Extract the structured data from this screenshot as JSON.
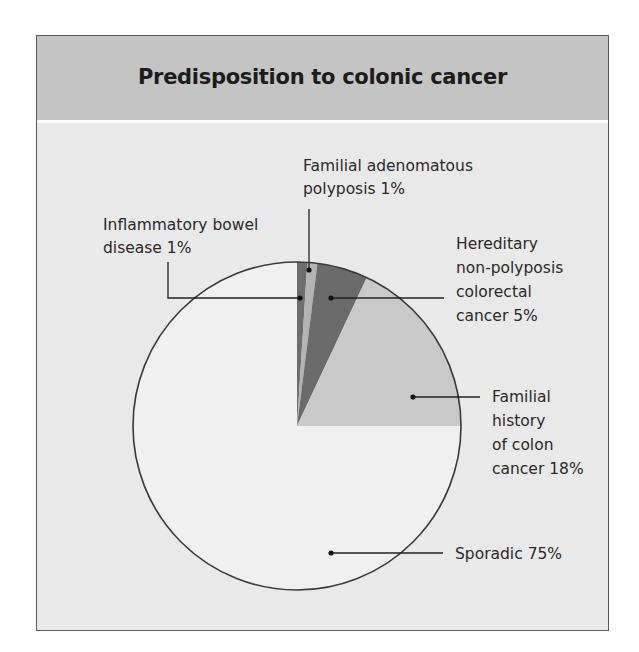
{
  "title": "Predisposition to colonic cancer",
  "colors": {
    "frame_border": "#5a5a5a",
    "header_bg": "#c4c4c4",
    "body_bg": "#e9e9e9",
    "pie_outline": "#3a3a3a",
    "leader_line": "#222222"
  },
  "labels": {
    "ibd": [
      "Inflammatory bowel",
      "disease 1%"
    ],
    "fap": [
      "Familial adenomatous",
      "polyposis 1%"
    ],
    "hnpcc": [
      "Hereditary",
      "non-polyposis",
      "colorectal",
      "cancer 5%"
    ],
    "familial": [
      "Familial",
      "history",
      "of colon",
      "cancer 18%"
    ],
    "sporadic": [
      "Sporadic 75%"
    ]
  },
  "chart_data": {
    "type": "pie",
    "title": "Predisposition to colonic cancer",
    "start_angle": "12 o'clock, clockwise",
    "slices": [
      {
        "name": "Inflammatory bowel disease",
        "value": 1,
        "color": "#6e6e6e"
      },
      {
        "name": "Familial adenomatous polyposis",
        "value": 1,
        "color": "#b3b3b3"
      },
      {
        "name": "Hereditary non-polyposis colorectal cancer",
        "value": 5,
        "color": "#6b6b6b"
      },
      {
        "name": "Familial history of colon cancer",
        "value": 18,
        "color": "#c9c9c9"
      },
      {
        "name": "Sporadic",
        "value": 75,
        "color": "#f0f0f0"
      }
    ],
    "categories": [
      "Inflammatory bowel disease",
      "Familial adenomatous polyposis",
      "Hereditary non-polyposis colorectal cancer",
      "Familial history of colon cancer",
      "Sporadic"
    ],
    "values": [
      1,
      1,
      5,
      18,
      75
    ],
    "unit": "%",
    "legend": "none (leader-line callouts)"
  }
}
